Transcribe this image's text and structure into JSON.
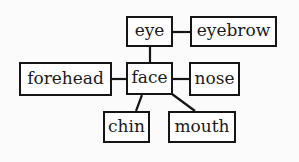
{
  "diagram": {
    "type": "concept-graph",
    "central_node": "face",
    "colors": {
      "background": "#fbfbfb",
      "box_border": "#151515",
      "box_fill": "#ffffff",
      "text": "#1a1a1a",
      "edge": "#151515"
    },
    "nodes": {
      "eye": {
        "label": "eye",
        "x": 126,
        "y": 16,
        "w": 47,
        "h": 31
      },
      "eyebrow": {
        "label": "eyebrow",
        "x": 190,
        "y": 16,
        "w": 87,
        "h": 31
      },
      "forehead": {
        "label": "forehead",
        "x": 19,
        "y": 62,
        "w": 93,
        "h": 34
      },
      "face": {
        "label": "face",
        "x": 126,
        "y": 62,
        "w": 47,
        "h": 33
      },
      "nose": {
        "label": "nose",
        "x": 189,
        "y": 62,
        "w": 51,
        "h": 34
      },
      "chin": {
        "label": "chin",
        "x": 103,
        "y": 111,
        "w": 47,
        "h": 32
      },
      "mouth": {
        "label": "mouth",
        "x": 168,
        "y": 111,
        "w": 68,
        "h": 32
      }
    },
    "edges": [
      {
        "from": "eye",
        "to": "eyebrow",
        "x1": 173,
        "y1": 32,
        "x2": 190,
        "y2": 32
      },
      {
        "from": "eye",
        "to": "face",
        "x1": 150,
        "y1": 47,
        "x2": 150,
        "y2": 62
      },
      {
        "from": "forehead",
        "to": "face",
        "x1": 112,
        "y1": 79,
        "x2": 126,
        "y2": 79
      },
      {
        "from": "face",
        "to": "nose",
        "x1": 173,
        "y1": 79,
        "x2": 189,
        "y2": 79
      },
      {
        "from": "face",
        "to": "chin",
        "x1": 142,
        "y1": 95,
        "x2": 136,
        "y2": 111
      },
      {
        "from": "face",
        "to": "mouth",
        "x1": 172,
        "y1": 94,
        "x2": 195,
        "y2": 111
      }
    ]
  }
}
